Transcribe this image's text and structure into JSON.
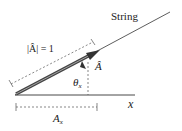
{
  "diagram": {
    "string_label": "String",
    "magnitude_label": "|Â| = 1",
    "vector_label": "Â",
    "angle_label": "θ",
    "angle_subscript": "x",
    "axis_label": "x",
    "component_label": "A",
    "component_subscript": "x",
    "colors": {
      "line": "#333333",
      "vector": "#444444",
      "dashed": "#555555"
    }
  }
}
